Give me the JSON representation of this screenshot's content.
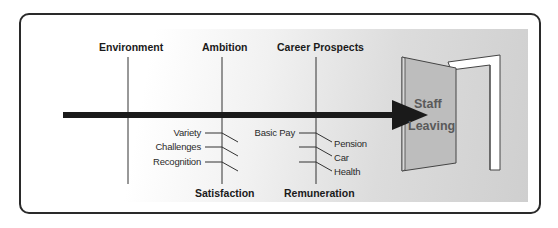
{
  "diagram": {
    "type": "fishbone",
    "effect": {
      "line1": "Staff",
      "line2": "Leaving"
    },
    "top_categories": [
      {
        "label": "Environment",
        "causes": []
      },
      {
        "label": "Ambition",
        "causes": []
      },
      {
        "label": "Career Prospects",
        "causes": []
      }
    ],
    "bottom_categories": [
      {
        "label": "Satisfaction",
        "causes": [
          "Variety",
          "Challenges",
          "Recognition"
        ]
      },
      {
        "label": "Remuneration",
        "causes_left": [
          "Basic Pay"
        ],
        "causes_right": [
          "Pension",
          "Car",
          "Health"
        ]
      }
    ],
    "colors": {
      "spine": "#1a1a1a",
      "bone": "#333333",
      "door_panel": "#bdbdbd",
      "door_text": "#5a5a5a",
      "panel_gradient_end": "#cfcfcf"
    }
  }
}
